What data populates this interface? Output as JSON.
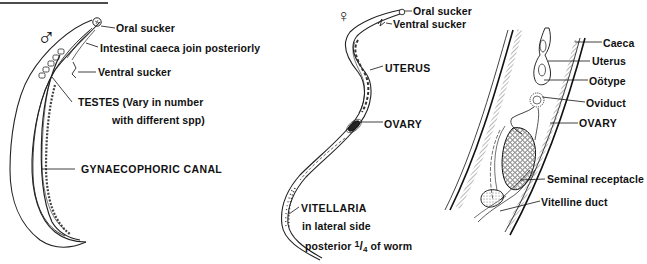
{
  "figure": {
    "male": {
      "symbol": "♂",
      "labels": {
        "oral_sucker": "Oral sucker",
        "intestinal_caeca": "Intestinal caeca join posteriorly",
        "ventral_sucker": "Ventral sucker",
        "testes_line1": "TESTES (Vary in number",
        "testes_line2": "with different spp)",
        "gynaecophoric_canal": "GYNAECOPHORIC  CANAL"
      }
    },
    "female": {
      "symbol": "♀",
      "labels": {
        "oral_sucker": "Oral sucker",
        "ventral_sucker": "Ventral sucker",
        "uterus": "UTERUS",
        "ovary": "OVARY",
        "vitellaria": "VITELLARIA",
        "vitellaria_line2": "in lateral side",
        "vitellaria_line3_pre": "posterior",
        "vitellaria_frac_num": "1",
        "vitellaria_frac_den": "4",
        "vitellaria_line3_post": "of worm"
      }
    },
    "detail": {
      "labels": {
        "caeca": "Caeca",
        "uterus": "Uterus",
        "ootype": "Oötype",
        "oviduct": "Oviduct",
        "ovary": "OVARY",
        "seminal_receptacle": "Seminal  receptacle",
        "vitelline_duct": "Vitelline  duct"
      }
    },
    "colors": {
      "ink": "#111111",
      "background": "#ffffff"
    }
  }
}
